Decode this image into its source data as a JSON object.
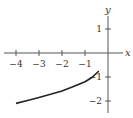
{
  "chart_data": {
    "type": "line",
    "title": "",
    "xlabel": "x",
    "ylabel": "y",
    "x_ticks": [
      -4,
      -3,
      -2,
      -1
    ],
    "y_ticks": [
      1,
      -1,
      -2
    ],
    "x_tick_labels": [
      "−4",
      "−3",
      "−2",
      "−1"
    ],
    "y_tick_labels": [
      "1",
      "−1",
      "−2"
    ],
    "xlim": [
      -4.4,
      0.6
    ],
    "ylim": [
      -2.4,
      1.5
    ],
    "grid": false,
    "series": [
      {
        "name": "curve",
        "x": [
          -4,
          -3.5,
          -3,
          -2.5,
          -2,
          -1.5,
          -1,
          -0.7,
          -0.4
        ],
        "y": [
          -2.1,
          -1.98,
          -1.85,
          -1.72,
          -1.58,
          -1.4,
          -1.2,
          -1.02,
          -0.75
        ]
      }
    ],
    "colors": {
      "axis": "#555555",
      "curve": "#222222"
    }
  }
}
